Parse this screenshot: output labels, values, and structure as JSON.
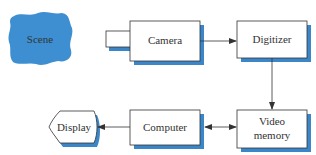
{
  "diagram": {
    "colors": {
      "accent": "#3d8fd1",
      "shadow": "#3a86c8",
      "stroke": "#333333",
      "box_fill": "#ffffff"
    },
    "nodes": [
      {
        "id": "scene",
        "label": "Scene",
        "shape": "blob"
      },
      {
        "id": "camera",
        "label": "Camera",
        "shape": "camera"
      },
      {
        "id": "digitizer",
        "label": "Digitizer",
        "shape": "box"
      },
      {
        "id": "video_memory",
        "label_line1": "Video",
        "label_line2": "memory",
        "shape": "box"
      },
      {
        "id": "computer",
        "label": "Computer",
        "shape": "box"
      },
      {
        "id": "display",
        "label": "Display",
        "shape": "display"
      }
    ],
    "edges": [
      {
        "from": "camera",
        "to": "digitizer",
        "direction": "forward"
      },
      {
        "from": "digitizer",
        "to": "video_memory",
        "direction": "forward"
      },
      {
        "from": "video_memory",
        "to": "computer",
        "direction": "bidirectional"
      },
      {
        "from": "computer",
        "to": "display",
        "direction": "forward"
      }
    ]
  }
}
